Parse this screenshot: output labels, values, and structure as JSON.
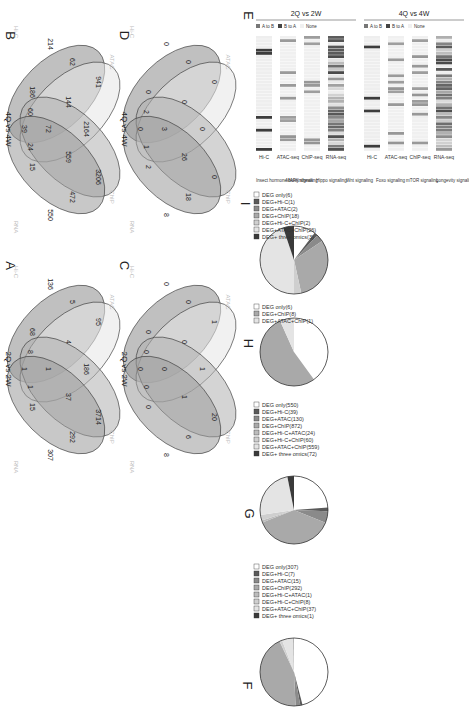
{
  "panels": {
    "A": {
      "letter": "A"
    },
    "B": {
      "letter": "B"
    },
    "C": {
      "letter": "C"
    },
    "D": {
      "letter": "D"
    },
    "E": {
      "letter": "E"
    },
    "F": {
      "letter": "F"
    },
    "G": {
      "letter": "G"
    },
    "H": {
      "letter": "H"
    },
    "I": {
      "letter": "I"
    }
  },
  "venn": {
    "A": {
      "comparison": "2Q vs 2W",
      "sets": {
        "hic": "Hi-C",
        "atac": "ATAC",
        "chip": "ChIP",
        "rna": "RNA"
      },
      "regions": {
        "atac": "95",
        "hic_atac": "5",
        "hic": "136",
        "atac_chip": "186",
        "hic_atac_chip": "4",
        "chip": "3714",
        "chip_rna": "292",
        "rna": "307",
        "atac_chip_rna": "37",
        "all4": "1",
        "hic_rna": "68",
        "hic_atac_rna": "8",
        "rna_hic_chip": "1",
        "rna_only_edge": "15",
        "center_small": "1"
      }
    },
    "B": {
      "comparison": "4Q vs 4W",
      "sets": {
        "hic": "Hi-C",
        "atac": "ATAC",
        "chip": "ChIP",
        "rna": "RNA"
      },
      "regions": {
        "atac": "941",
        "hic_atac": "62",
        "hic": "214",
        "atac_chip": "2164",
        "hic_atac_chip": "144",
        "chip": "3206",
        "chip_rna": "472",
        "rna": "550",
        "atac_chip_rna": "559",
        "all4": "72",
        "hic_rna": "186",
        "hic_atac_rna": "60",
        "rna_hic_chip": "24",
        "rna_only_edge": "15",
        "center_small": "39"
      }
    },
    "C": {
      "comparison": "2Q vs 2W",
      "sets": {
        "hic": "Hi-C",
        "atac": "ATAC",
        "chip": "ChIP",
        "rna": "RNA"
      },
      "regions": {
        "atac": "1",
        "hic_atac": "0",
        "hic": "0",
        "atac_chip": "1",
        "hic_atac_chip": "0",
        "chip": "20",
        "chip_rna": "6",
        "rna": "8",
        "atac_chip_rna": "1",
        "all4": "0",
        "hic_rna": "0",
        "hic_atac_rna": "0",
        "rna_hic_chip": "0",
        "rna_only_edge": "0",
        "center_small": "0"
      }
    },
    "D": {
      "comparison": "4Q vs 4W",
      "sets": {
        "hic": "Hi-C",
        "atac": "ATAC",
        "chip": "ChIP",
        "rna": "RNA"
      },
      "regions": {
        "atac": "0",
        "hic_atac": "0",
        "hic": "0",
        "atac_chip": "0",
        "hic_atac_chip": "0",
        "chip": "0",
        "chip_rna": "18",
        "rna": "8",
        "atac_chip_rna": "26",
        "all4": "3",
        "hic_rna": "0",
        "hic_atac_rna": "2",
        "rna_hic_chip": "1",
        "rna_only_edge": "2",
        "center_small": "0"
      }
    }
  },
  "heatmap": {
    "blocks": [
      {
        "title": "2Q vs 2W"
      },
      {
        "title": "4Q vs 4W"
      }
    ],
    "legend": {
      "hic_states": [
        "A to B",
        "B to A",
        "None"
      ],
      "peak_states": [
        "Up peak",
        "Down peak"
      ],
      "peak_scale": [
        "-6",
        "0",
        "6"
      ],
      "rna_scale": [
        "-2",
        "0",
        "2"
      ]
    },
    "columns": [
      "Hi-C",
      "ATAC-seq",
      "ChIP-seq",
      "RNA-seq"
    ],
    "pathways": [
      "Insect hormone biosynthesis",
      "MAPK signaling",
      "Hippo signaling",
      "Wnt signaling",
      "Foxo signaling",
      "mTOR signaling",
      "Longevity signaling"
    ]
  },
  "chart_data": [
    {
      "type": "pie",
      "panel": "F",
      "categories": [
        "DEG only",
        "DEG+Hi-C",
        "DEG+ATAC",
        "DEG+ChIP",
        "DEG+Hi-C+ATAC",
        "DEG+Hi-C+ChIP",
        "DEG+ATAC+ChIP",
        "DEG+ three omics"
      ],
      "values": [
        307,
        7,
        15,
        292,
        1,
        8,
        37,
        1
      ],
      "labels": [
        "DEG only(307)",
        "DEG+Hi-C(7)",
        "DEG+ATAC(15)",
        "DEG+ChIP(292)",
        "DEG+Hi-C+ATAC(1)",
        "DEG+Hi-C+ChIP(8)",
        "DEG+ATAC+ChIP(37)",
        "DEG+ three omics(1)"
      ],
      "colors": [
        "#ffffff",
        "#5a5a5a",
        "#8a8a8a",
        "#a9a9a9",
        "#bcbcbc",
        "#cfcfcf",
        "#e4e4e4",
        "#3a3a3a"
      ]
    },
    {
      "type": "pie",
      "panel": "G",
      "categories": [
        "DEG only",
        "DEG+Hi-C",
        "DEG+ATAC",
        "DEG+ChIP",
        "DEG+Hi-C+ATAC",
        "DEG+Hi-C+ChIP",
        "DEG+ATAC+ChIP",
        "DEG+ three omics"
      ],
      "values": [
        550,
        39,
        130,
        872,
        24,
        60,
        559,
        72
      ],
      "labels": [
        "DEG only(550)",
        "DEG+Hi-C(39)",
        "DEG+ATAC(130)",
        "DEG+ChIP(872)",
        "DEG+Hi-C+ATAC(24)",
        "DEG+Hi-C+ChIP(60)",
        "DEG+ATAC+ChIP(559)",
        "DEG+ three omics(72)"
      ],
      "colors": [
        "#ffffff",
        "#5a5a5a",
        "#8a8a8a",
        "#a9a9a9",
        "#bcbcbc",
        "#cfcfcf",
        "#e4e4e4",
        "#3a3a3a"
      ]
    },
    {
      "type": "pie",
      "panel": "H",
      "categories": [
        "DEG only",
        "DEG+ChIP",
        "DEG+ATAC+ChIP"
      ],
      "values": [
        6,
        8,
        1
      ],
      "labels": [
        "DEG only(6)",
        "DEG+ChIP(8)",
        "DEG+ATAC+ChIP(1)"
      ],
      "colors": [
        "#ffffff",
        "#a9a9a9",
        "#e4e4e4"
      ]
    },
    {
      "type": "pie",
      "panel": "I",
      "categories": [
        "DEG only",
        "DEG+Hi-C",
        "DEG+ATAC",
        "DEG+ChIP",
        "DEG+Hi-C+ChIP",
        "DEG+ATAC+ChIP",
        "DEG+ three omics"
      ],
      "values": [
        6,
        1,
        2,
        18,
        2,
        26,
        3
      ],
      "labels": [
        "DEG only(6)",
        "DEG+Hi-C(1)",
        "DEG+ATAC(2)",
        "DEG+ChIP(18)",
        "DEG+Hi-C+ChIP(2)",
        "DEG+ATAC+ChIP(26)",
        "DEG+ three omics(3)"
      ],
      "colors": [
        "#ffffff",
        "#5a5a5a",
        "#8a8a8a",
        "#a9a9a9",
        "#cfcfcf",
        "#e4e4e4",
        "#3a3a3a"
      ]
    }
  ]
}
